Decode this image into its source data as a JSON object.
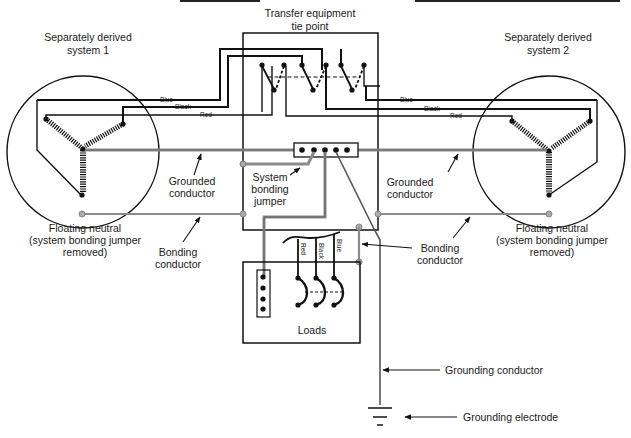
{
  "diagram": {
    "type": "electrical-wiring-diagram",
    "labels": {
      "tie_point": [
        "Transfer equipment",
        "tie point"
      ],
      "sds1": [
        "Separately derived",
        "system 1"
      ],
      "sds2": [
        "Separately derived",
        "system 2"
      ],
      "grounded_left": [
        "Grounded",
        "conductor"
      ],
      "grounded_right": [
        "Grounded",
        "conductor"
      ],
      "system_bonding_jumper": [
        "System",
        "bonding",
        "jumper"
      ],
      "floating_neutral_left": [
        "Floating neutral",
        "(system bonding jumper",
        "removed)"
      ],
      "floating_neutral_right": [
        "Floating neutral",
        "(system bonding jumper",
        "removed)"
      ],
      "bonding_left": [
        "Bonding",
        "conductor"
      ],
      "bonding_right": [
        "Bonding",
        "conductor"
      ],
      "loads": "Loads",
      "grounding_conductor": "Grounding conductor",
      "grounding_electrode": "Grounding electrode"
    },
    "wire_colors": {
      "left": [
        "Blue",
        "Black",
        "Red"
      ],
      "right": [
        "Blue",
        "Black",
        "Red"
      ],
      "loads": [
        "Red",
        "Black",
        "Blue"
      ]
    },
    "colors": {
      "line": "#111111",
      "grounded_gray": "#8a8a8a",
      "text": "#1a1a1a"
    }
  }
}
